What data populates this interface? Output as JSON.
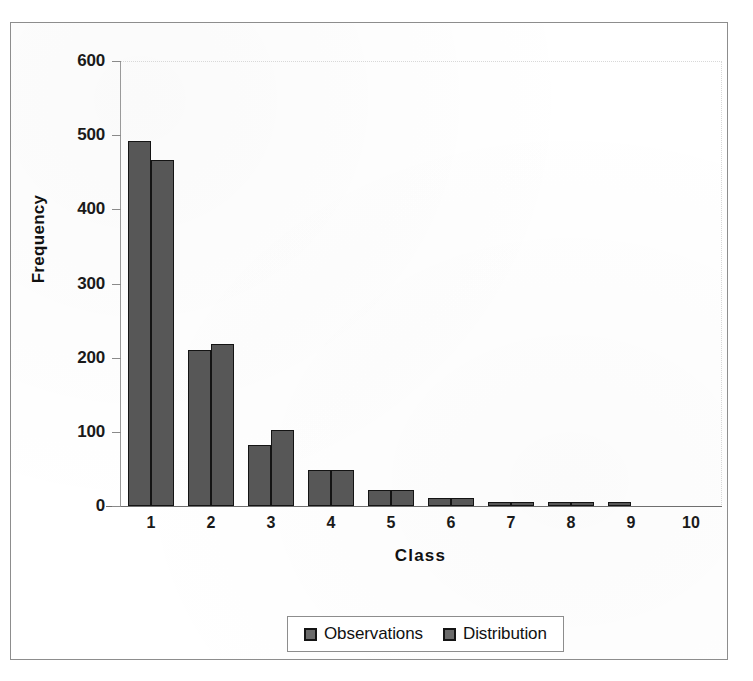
{
  "chart_data": {
    "type": "bar",
    "title": "",
    "xlabel": "Class",
    "ylabel": "Frequency",
    "categories": [
      "1",
      "2",
      "3",
      "4",
      "5",
      "6",
      "7",
      "8",
      "9",
      "10"
    ],
    "series": [
      {
        "name": "Observations",
        "color": "#575757",
        "values": [
          492,
          210,
          82,
          49,
          22,
          11,
          5,
          3,
          2,
          0
        ]
      },
      {
        "name": "Distribution",
        "color": "#575757",
        "values": [
          466,
          218,
          102,
          49,
          22,
          11,
          4,
          2,
          0,
          0
        ]
      }
    ],
    "ylim": [
      0,
      600
    ],
    "ytick_values": [
      0,
      100,
      200,
      300,
      400,
      500,
      600
    ],
    "ytick_labels": [
      "0",
      "100",
      "200",
      "300",
      "400",
      "500",
      "600"
    ],
    "grid": false,
    "legend_position": "bottom",
    "legend_entries": [
      "Observations",
      "Distribution"
    ]
  },
  "figure": {
    "bar_fill_color": "#575757",
    "bar_edge_color": "#141414",
    "axis_color": "#8a8a8a",
    "background_color": "#ffffff",
    "frame_color": "#8d8d8d"
  }
}
